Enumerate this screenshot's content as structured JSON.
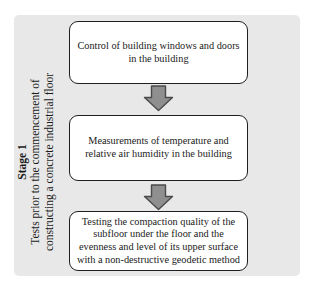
{
  "stage_label": {
    "title": "Stage 1",
    "subtitle": "Tests prior to the commencement of constructing a concrete industrial floor"
  },
  "flow": {
    "steps": [
      {
        "text": "Control of building windows and doors in the building"
      },
      {
        "text": "Measurements of temperature and relative air humidity in the building"
      },
      {
        "text": "Testing the compaction quality of the subfloor under the floor and the evenness and level of its upper surface with a non-destructive geodetic method"
      }
    ]
  },
  "colors": {
    "page_bg": "#ffffff",
    "panel_bg": "#e8e8e8",
    "box_bg": "#ffffff",
    "box_border": "#1f1f1f",
    "arrow_fill": "#8f8f8f",
    "arrow_border": "#4a4a4a",
    "text": "#1a1a1a"
  }
}
